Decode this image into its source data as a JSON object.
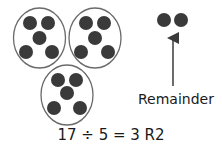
{
  "diagram": {
    "groups": [
      {
        "cx": 39.5,
        "cy": 38,
        "rx": 26,
        "ry": 30,
        "dots": 5
      },
      {
        "cx": 95,
        "cy": 38,
        "rx": 26,
        "ry": 30,
        "dots": 5
      },
      {
        "cx": 67,
        "cy": 95,
        "rx": 26,
        "ry": 30,
        "dots": 5
      }
    ],
    "remainder_dots": 2,
    "remainder_label": "Remainder",
    "equation": "17 ÷ 5 = 3 R2",
    "colors": {
      "dot": "#3a3a3a",
      "oval_stroke": "#6a6a6a",
      "arrow": "#3a3a3a",
      "text": "#1a1a1a"
    }
  }
}
